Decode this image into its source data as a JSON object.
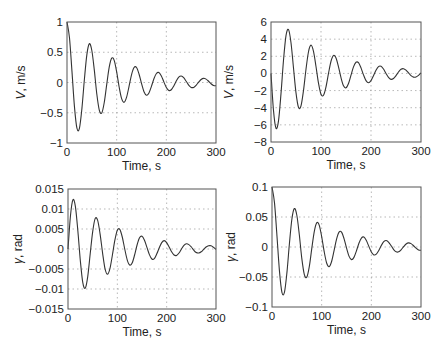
{
  "chart_data": [
    {
      "type": "line",
      "id": "top-left",
      "title": "",
      "xlabel": "Time, s",
      "ylabel": "V, m/s",
      "ylabel_var": "V",
      "ylabel_unit": ", m/s",
      "xlim": [
        0,
        300
      ],
      "ylim": [
        -1,
        1
      ],
      "xticks": [
        0,
        100,
        200,
        300
      ],
      "xtick_labels": [
        "0",
        "100",
        "200",
        "300"
      ],
      "yticks": [
        -1,
        -0.5,
        0,
        0.5,
        1
      ],
      "ytick_labels": [
        "−1",
        "−0.5",
        "0",
        "0.5",
        "1"
      ],
      "grid": true,
      "box": {
        "x0": 67,
        "y0": 22,
        "x1": 216,
        "y1": 143
      },
      "x": [
        0,
        5,
        10,
        15,
        20,
        25,
        30,
        35,
        40,
        45,
        50,
        55,
        60,
        65,
        70,
        75,
        80,
        85,
        90,
        95,
        100,
        105,
        110,
        115,
        120,
        125,
        130,
        135,
        140,
        145,
        150,
        155,
        160,
        165,
        170,
        175,
        180,
        185,
        190,
        195,
        200,
        205,
        210,
        215,
        220,
        225,
        230,
        235,
        240,
        245,
        250,
        255,
        260,
        265,
        270,
        275,
        280,
        285,
        290,
        295,
        300
      ],
      "series": [
        {
          "name": "V",
          "values": [
            1,
            0.739,
            0.184,
            -0.398,
            -0.756,
            -0.757,
            -0.431,
            0.049,
            0.462,
            0.641,
            0.529,
            0.204,
            -0.19,
            -0.455,
            -0.503,
            -0.331,
            -0.031,
            0.253,
            0.403,
            0.365,
            0.174,
            -0.074,
            -0.267,
            -0.328,
            -0.242,
            -0.06,
            0.131,
            0.248,
            0.248,
            0.141,
            -0.016,
            -0.152,
            -0.21,
            -0.173,
            -0.064,
            0.062,
            0.149,
            0.165,
            0.108,
            0.01,
            -0.083,
            -0.132,
            -0.12,
            -0.057,
            0.024,
            0.088,
            0.108,
            0.079,
            0.02,
            -0.043,
            -0.081,
            -0.081,
            -0.046,
            0.005,
            0.05,
            0.069,
            0.056,
            0.021,
            -0.02,
            -0.049,
            -0.054
          ]
        }
      ]
    },
    {
      "type": "line",
      "id": "top-right",
      "title": "",
      "xlabel": "Time, s",
      "ylabel": "V, m/s",
      "ylabel_var": "V",
      "ylabel_unit": ", m/s",
      "xlim": [
        0,
        300
      ],
      "ylim": [
        -8,
        6
      ],
      "xticks": [
        0,
        100,
        200,
        300
      ],
      "xtick_labels": [
        "0",
        "100",
        "200",
        "300"
      ],
      "yticks": [
        -8,
        -6,
        -4,
        -2,
        0,
        2,
        4,
        6
      ],
      "ytick_labels": [
        "−8",
        "−6",
        "−4",
        "−2",
        "0",
        "2",
        "4",
        "6"
      ],
      "grid": true,
      "box": {
        "x0": 271,
        "y0": 22,
        "x1": 421,
        "y1": 142
      },
      "x": [
        0,
        5,
        10,
        15,
        20,
        25,
        30,
        35,
        40,
        45,
        50,
        55,
        60,
        65,
        70,
        75,
        80,
        85,
        90,
        95,
        100,
        105,
        110,
        115,
        120,
        125,
        130,
        135,
        140,
        145,
        150,
        155,
        160,
        165,
        170,
        175,
        180,
        185,
        190,
        195,
        200,
        205,
        210,
        215,
        220,
        225,
        230,
        235,
        240,
        245,
        250,
        255,
        260,
        265,
        270,
        275,
        280,
        285,
        290,
        295,
        300
      ],
      "series": [
        {
          "name": "V",
          "values": [
            0,
            -4.33,
            -6.4,
            -5.53,
            -2.36,
            1.53,
            4.4,
            5.12,
            3.58,
            0.63,
            -2.27,
            -3.96,
            -3.78,
            -1.99,
            0.49,
            2.53,
            3.3,
            2.58,
            0.81,
            -1.14,
            -2.43,
            -2.55,
            -1.56,
            0,
            1.42,
            2.1,
            1.81,
            0.77,
            -0.5,
            -1.45,
            -1.68,
            -1.17,
            -0.2,
            0.76,
            1.3,
            1.25,
            0.65,
            -0.17,
            -0.84,
            -1.09,
            -0.84,
            -0.26,
            0.37,
            0.8,
            0.84,
            0.51,
            0,
            -0.47,
            -0.69,
            -0.59,
            -0.25,
            0.17,
            0.48,
            0.55,
            0.38,
            0.06,
            -0.25,
            -0.43,
            -0.41,
            -0.22,
            0.06
          ]
        }
      ]
    },
    {
      "type": "line",
      "id": "bottom-left",
      "title": "",
      "xlabel": "Time, s",
      "ylabel": "γ, rad",
      "ylabel_var": "γ",
      "ylabel_unit": ", rad",
      "xlim": [
        0,
        300
      ],
      "ylim": [
        -0.015,
        0.015
      ],
      "xticks": [
        0,
        100,
        200,
        300
      ],
      "xtick_labels": [
        "0",
        "100",
        "200",
        "300"
      ],
      "yticks": [
        -0.015,
        -0.01,
        -0.005,
        0,
        0.005,
        0.01,
        0.015
      ],
      "ytick_labels": [
        "−0.015",
        "−0.01",
        "−0.005",
        "0",
        "0.005",
        "0.01",
        "0.015"
      ],
      "grid": true,
      "box": {
        "x0": 68,
        "y0": 189,
        "x1": 216,
        "y1": 309
      },
      "x": [
        0,
        5,
        10,
        15,
        20,
        25,
        30,
        35,
        40,
        45,
        50,
        55,
        60,
        65,
        70,
        75,
        80,
        85,
        90,
        95,
        100,
        105,
        110,
        115,
        120,
        125,
        130,
        135,
        140,
        145,
        150,
        155,
        160,
        165,
        170,
        175,
        180,
        185,
        190,
        195,
        200,
        205,
        210,
        215,
        220,
        225,
        230,
        235,
        240,
        245,
        250,
        255,
        260,
        265,
        270,
        275,
        280,
        285,
        290,
        295,
        300
      ],
      "series": [
        {
          "name": "gamma",
          "values": [
            0,
            0.0083,
            0.0123,
            0.0106,
            0.0045,
            -0.0029,
            -0.0084,
            -0.0098,
            -0.0069,
            -0.0012,
            0.0043,
            0.0076,
            0.0072,
            0.0038,
            -0.0009,
            -0.0049,
            -0.0063,
            -0.0049,
            -0.0015,
            0.0022,
            0.0047,
            0.0049,
            0.003,
            0,
            -0.0027,
            -0.004,
            -0.0035,
            -0.0015,
            0.001,
            0.0028,
            0.0032,
            0.0022,
            0.0004,
            -0.0014,
            -0.0025,
            -0.0024,
            -0.0012,
            0.0003,
            0.0016,
            0.0021,
            0.0016,
            0.0005,
            -0.0007,
            -0.0015,
            -0.0016,
            -0.001,
            0,
            0.0009,
            0.0013,
            0.0011,
            0.0005,
            -0.0003,
            -0.0009,
            -0.001,
            -0.0007,
            -0.0001,
            0.0005,
            0.0008,
            0.0008,
            0.0004,
            -0.0001
          ]
        }
      ]
    },
    {
      "type": "line",
      "id": "bottom-right",
      "title": "",
      "xlabel": "Time, s",
      "ylabel": "γ, rad",
      "ylabel_var": "γ",
      "ylabel_unit": ", rad",
      "xlim": [
        0,
        300
      ],
      "ylim": [
        -0.1,
        0.1
      ],
      "xticks": [
        0,
        100,
        200,
        300
      ],
      "xtick_labels": [
        "0",
        "100",
        "200",
        "300"
      ],
      "yticks": [
        -0.1,
        -0.05,
        0,
        0.05,
        0.1
      ],
      "ytick_labels": [
        "−0.1",
        "−0.05",
        "0",
        "0.05",
        "0.1"
      ],
      "grid": true,
      "box": {
        "x0": 272,
        "y0": 187,
        "x1": 421,
        "y1": 307
      },
      "x": [
        0,
        5,
        10,
        15,
        20,
        25,
        30,
        35,
        40,
        45,
        50,
        55,
        60,
        65,
        70,
        75,
        80,
        85,
        90,
        95,
        100,
        105,
        110,
        115,
        120,
        125,
        130,
        135,
        140,
        145,
        150,
        155,
        160,
        165,
        170,
        175,
        180,
        185,
        190,
        195,
        200,
        205,
        210,
        215,
        220,
        225,
        230,
        235,
        240,
        245,
        250,
        255,
        260,
        265,
        270,
        275,
        280,
        285,
        290,
        295,
        300
      ],
      "series": [
        {
          "name": "gamma",
          "values": [
            0.1,
            0.0739,
            0.0184,
            -0.0398,
            -0.0756,
            -0.0757,
            -0.0431,
            0.0049,
            0.0462,
            0.0641,
            0.0529,
            0.0204,
            -0.019,
            -0.0455,
            -0.0503,
            -0.0331,
            -0.0031,
            0.0253,
            0.0403,
            0.0365,
            0.0174,
            -0.0074,
            -0.0267,
            -0.0328,
            -0.0242,
            -0.006,
            0.0131,
            0.0248,
            0.0248,
            0.0141,
            -0.0016,
            -0.0152,
            -0.021,
            -0.0173,
            -0.0064,
            0.0062,
            0.0149,
            0.0165,
            0.0108,
            0.001,
            -0.0083,
            -0.0132,
            -0.012,
            -0.0057,
            0.0024,
            0.0088,
            0.0108,
            0.0079,
            0.002,
            -0.0043,
            -0.0081,
            -0.0081,
            -0.0046,
            0.0005,
            0.005,
            0.0069,
            0.0056,
            0.0021,
            -0.002,
            -0.0049,
            -0.0054
          ]
        }
      ]
    }
  ]
}
